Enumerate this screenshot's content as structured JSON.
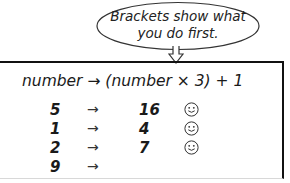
{
  "callout": {
    "line1": "Brackets show what",
    "line2": "you do first."
  },
  "rule": {
    "text": "number → (number × 3) + 1"
  },
  "arrow_glyph": "→",
  "rows": [
    {
      "input": "5",
      "output": "16",
      "correct": true
    },
    {
      "input": "1",
      "output": "4",
      "correct": true
    },
    {
      "input": "2",
      "output": "7",
      "correct": true
    },
    {
      "input": "9",
      "output": "",
      "correct": false
    }
  ],
  "icons": {
    "smiley": "smiley-face-icon",
    "callout_pointer": "down-arrow-pointer-icon"
  }
}
